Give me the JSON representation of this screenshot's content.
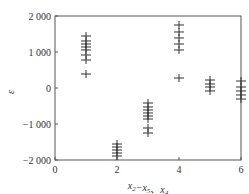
{
  "chart_data": {
    "type": "scatter",
    "title": "",
    "xlabel": "x2−x5、x4",
    "xlabel_parts": [
      {
        "text": "x",
        "sub": "2"
      },
      {
        "text": "−x",
        "sub": "5"
      },
      {
        "text": "、x",
        "sub": "4"
      }
    ],
    "ylabel": "ε",
    "xlim": [
      0,
      6
    ],
    "ylim": [
      -2000,
      2000
    ],
    "xticks": [
      0,
      2,
      4,
      6
    ],
    "xtick_labels": [
      "0",
      "2",
      "4",
      "6"
    ],
    "yticks": [
      2000,
      1000,
      0,
      -1000,
      -2000
    ],
    "ytick_labels": [
      "2 000",
      "1 000",
      "0",
      "−1 000",
      "−2 000"
    ],
    "grid": false,
    "legend": null,
    "marker": "+",
    "color": "#333333",
    "series": [
      {
        "name": "residuals",
        "points": [
          {
            "x": 1,
            "y": 1444
          },
          {
            "x": 1,
            "y": 1306
          },
          {
            "x": 1,
            "y": 1222
          },
          {
            "x": 1,
            "y": 1139
          },
          {
            "x": 1,
            "y": 1056
          },
          {
            "x": 1,
            "y": 917
          },
          {
            "x": 1,
            "y": 778
          },
          {
            "x": 1,
            "y": 389
          },
          {
            "x": 2,
            "y": -1556
          },
          {
            "x": 2,
            "y": -1639
          },
          {
            "x": 2,
            "y": -1722
          },
          {
            "x": 2,
            "y": -1806
          },
          {
            "x": 2,
            "y": -1889
          },
          {
            "x": 3,
            "y": -417
          },
          {
            "x": 3,
            "y": -528
          },
          {
            "x": 3,
            "y": -611
          },
          {
            "x": 3,
            "y": -694
          },
          {
            "x": 3,
            "y": -778
          },
          {
            "x": 3,
            "y": -861
          },
          {
            "x": 3,
            "y": -1111
          },
          {
            "x": 3,
            "y": -1250
          },
          {
            "x": 4,
            "y": 1750
          },
          {
            "x": 4,
            "y": 1556
          },
          {
            "x": 4,
            "y": 1389
          },
          {
            "x": 4,
            "y": 1222
          },
          {
            "x": 4,
            "y": 1056
          },
          {
            "x": 4,
            "y": 278
          },
          {
            "x": 5,
            "y": 222
          },
          {
            "x": 5,
            "y": 111
          },
          {
            "x": 5,
            "y": 28
          },
          {
            "x": 5,
            "y": -83
          },
          {
            "x": 6,
            "y": 194
          },
          {
            "x": 6,
            "y": 28
          },
          {
            "x": 6,
            "y": -83
          },
          {
            "x": 6,
            "y": -194
          },
          {
            "x": 6,
            "y": -306
          }
        ]
      }
    ]
  }
}
